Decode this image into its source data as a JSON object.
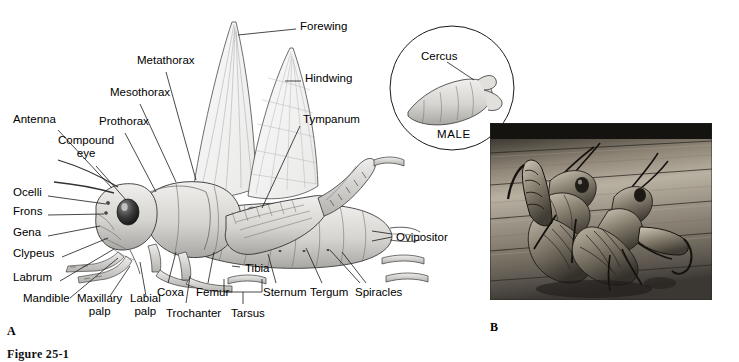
{
  "figure": {
    "panel_a_letter": "A",
    "panel_b_letter": "B",
    "caption": "Figure 25-1"
  },
  "panel_a": {
    "name": "grasshopper-external-anatomy-drawing",
    "labels": [
      {
        "id": "forewing",
        "text": "Forewing",
        "x": 300,
        "y": 26,
        "align": "left"
      },
      {
        "id": "hindwing",
        "text": "Hindwing",
        "x": 305,
        "y": 78,
        "align": "left"
      },
      {
        "id": "metathorax",
        "text": "Metathorax",
        "x": 137,
        "y": 60,
        "align": "left"
      },
      {
        "id": "mesothorax",
        "text": "Mesothorax",
        "x": 110,
        "y": 92,
        "align": "left"
      },
      {
        "id": "prothorax",
        "text": "Prothorax",
        "x": 99,
        "y": 121,
        "align": "left"
      },
      {
        "id": "tympanum",
        "text": "Tympanum",
        "x": 303,
        "y": 119,
        "align": "left"
      },
      {
        "id": "antenna",
        "text": "Antenna",
        "x": 13,
        "y": 119,
        "align": "left"
      },
      {
        "id": "compound-eye",
        "text": "Compound\neye",
        "x": 58,
        "y": 140,
        "align": "left"
      },
      {
        "id": "ocelli",
        "text": "Ocelli",
        "x": 13,
        "y": 192,
        "align": "left"
      },
      {
        "id": "frons",
        "text": "Frons",
        "x": 13,
        "y": 211,
        "align": "left"
      },
      {
        "id": "gena",
        "text": "Gena",
        "x": 13,
        "y": 232,
        "align": "left"
      },
      {
        "id": "clypeus",
        "text": "Clypeus",
        "x": 13,
        "y": 253,
        "align": "left"
      },
      {
        "id": "labrum",
        "text": "Labrum",
        "x": 13,
        "y": 277,
        "align": "left"
      },
      {
        "id": "mandible",
        "text": "Mandible",
        "x": 23,
        "y": 303,
        "align": "left"
      },
      {
        "id": "maxillary-palp",
        "text": "Maxillary\npalp",
        "x": 77,
        "y": 303,
        "align": "left"
      },
      {
        "id": "labial-palp",
        "text": "Labial\npalp",
        "x": 130,
        "y": 303,
        "align": "left"
      },
      {
        "id": "coxa",
        "text": "Coxa",
        "x": 157,
        "y": 287,
        "align": "left"
      },
      {
        "id": "trochanter",
        "text": "Trochanter",
        "x": 166,
        "y": 308,
        "align": "left"
      },
      {
        "id": "femur",
        "text": "Femur",
        "x": 196,
        "y": 287,
        "align": "left"
      },
      {
        "id": "tibia",
        "text": "Tibia",
        "x": 243,
        "y": 263,
        "align": "left"
      },
      {
        "id": "tarsus",
        "text": "Tarsus",
        "x": 231,
        "y": 308,
        "align": "left"
      },
      {
        "id": "sternum",
        "text": "Sternum",
        "x": 263,
        "y": 287,
        "align": "left"
      },
      {
        "id": "tergum",
        "text": "Tergum",
        "x": 310,
        "y": 287,
        "align": "left"
      },
      {
        "id": "spiracles",
        "text": "Spiracles",
        "x": 355,
        "y": 287,
        "align": "left"
      },
      {
        "id": "ovipositor",
        "text": "Ovipositor",
        "x": 396,
        "y": 232,
        "align": "left"
      }
    ]
  },
  "inset": {
    "name": "male-abdomen-tip-inset",
    "cercus_label": "Cercus",
    "sex_label": "MALE"
  },
  "panel_b": {
    "name": "mating-grasshoppers-photograph",
    "description": "black-and-white photograph of two grasshoppers mating on weathered wooden boards"
  },
  "colors": {
    "background": "#ffffff",
    "ink": "#000000",
    "body_fill": "#d8d6d2",
    "body_shade": "#a8a6a2",
    "wing_fill": "#f2f2f1",
    "photo_dark": "#2b2823",
    "photo_mid": "#7d766a",
    "photo_light": "#c3bcae"
  }
}
